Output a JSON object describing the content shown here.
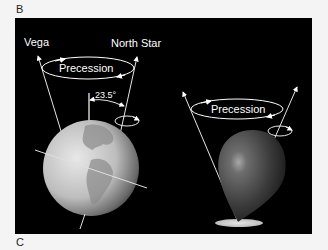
{
  "panels": {
    "top_label": "B",
    "bottom_label": "C"
  },
  "diagram": {
    "earth": {
      "labels": {
        "left_star": "Vega",
        "right_star": "North Star",
        "motion": "Precession",
        "tilt_angle": "23.5°"
      }
    },
    "spinning_top": {
      "labels": {
        "motion": "Precession"
      }
    },
    "colors": {
      "background": "#000000",
      "page": "#f4f4f4",
      "lines": "#ffffff"
    }
  }
}
